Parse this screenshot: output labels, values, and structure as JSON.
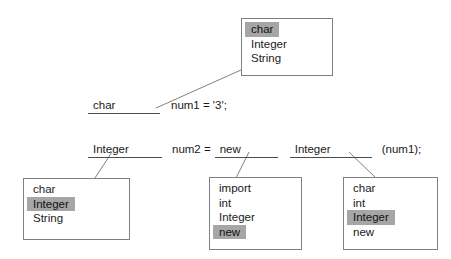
{
  "diagram": {
    "colors": {
      "background": "#ffffff",
      "box_border": "#808080",
      "text": "#1a1a1a",
      "highlight": "#a6a6a6",
      "blank_rule": "#4d4d4d",
      "connector": "#808080"
    }
  },
  "code_lines": [
    {
      "id": "line1",
      "blank_value": "char",
      "rest": "num1 = '3';"
    },
    {
      "id": "line2",
      "blank1_value": "Integer",
      "mid": "num2 =",
      "blank2_value": "new",
      "blank3_value": "Integer",
      "tail": "(num1);"
    }
  ],
  "dropdowns": [
    {
      "id": "dropdown-top",
      "name": "dropdown-char-type",
      "items": [
        {
          "label": "char",
          "selected": true
        },
        {
          "label": "Integer",
          "selected": false
        },
        {
          "label": "String",
          "selected": false
        }
      ]
    },
    {
      "id": "dropdown-left",
      "name": "dropdown-integer-type",
      "items": [
        {
          "label": "char",
          "selected": false
        },
        {
          "label": "Integer",
          "selected": true
        },
        {
          "label": "String",
          "selected": false
        }
      ]
    },
    {
      "id": "dropdown-middle",
      "name": "dropdown-new-keyword",
      "items": [
        {
          "label": "import",
          "selected": false
        },
        {
          "label": "int",
          "selected": false
        },
        {
          "label": "Integer",
          "selected": false
        },
        {
          "label": "new",
          "selected": true
        }
      ]
    },
    {
      "id": "dropdown-right",
      "name": "dropdown-integer-constructor",
      "items": [
        {
          "label": "char",
          "selected": false
        },
        {
          "label": "int",
          "selected": false
        },
        {
          "label": "Integer",
          "selected": true
        },
        {
          "label": "new",
          "selected": false
        }
      ]
    }
  ]
}
